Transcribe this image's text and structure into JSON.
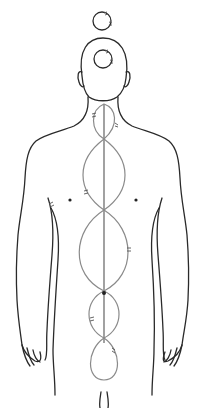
{
  "figure": {
    "colors": {
      "outline": "#2a2a2a",
      "flow": "#8a8a8a",
      "background": "#ffffff"
    }
  },
  "crown_circles": [
    {
      "name": "above-head",
      "cx": 102,
      "cy": 21,
      "r": 9
    },
    {
      "name": "in-head",
      "cx": 103,
      "cy": 59,
      "r": 9
    }
  ],
  "spine": {
    "x": 104,
    "y1": 104,
    "y2": 343
  },
  "loops": [
    {
      "name": "neck-loop",
      "top": 104,
      "bottom": 139,
      "half_width": 13
    },
    {
      "name": "upper-chest-loop",
      "top": 139,
      "bottom": 210,
      "half_width": 22
    },
    {
      "name": "abdomen-loop",
      "top": 210,
      "bottom": 291,
      "half_width": 26
    },
    {
      "name": "lower-loop",
      "top": 291,
      "bottom": 338,
      "half_width": 15
    },
    {
      "name": "base-loop",
      "top": 338,
      "bottom": 380,
      "half_width": 15
    }
  ],
  "points": [
    {
      "name": "left-shoulder-blade-point",
      "x": 70,
      "y": 200
    },
    {
      "name": "right-shoulder-blade-point",
      "x": 136,
      "y": 200
    },
    {
      "name": "spine-node",
      "x": 104,
      "y": 293
    }
  ]
}
